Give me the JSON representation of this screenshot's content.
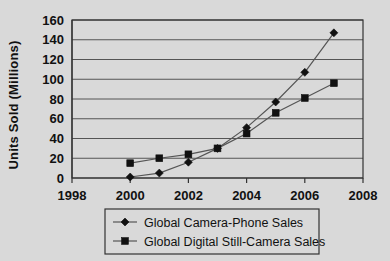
{
  "chart_data": {
    "type": "line",
    "title": "",
    "xlabel": "",
    "ylabel": "Units Sold  (Millions)",
    "x": [
      2000,
      2001,
      2002,
      2003,
      2004,
      2005,
      2006,
      2007
    ],
    "xlim": [
      1998,
      2008
    ],
    "ylim": [
      0,
      160
    ],
    "xticks": [
      "1998",
      "2000",
      "2002",
      "2004",
      "2006",
      "2008"
    ],
    "yticks": [
      "0",
      "20",
      "40",
      "60",
      "80",
      "100",
      "120",
      "140",
      "160"
    ],
    "grid": "horizontal",
    "legend_position": "bottom",
    "series": [
      {
        "name": "Global Camera-Phone Sales",
        "marker": "diamond",
        "values": [
          1,
          5,
          16,
          30,
          51,
          77,
          107,
          147
        ]
      },
      {
        "name": "Global Digital Still-Camera Sales",
        "marker": "square",
        "values": [
          15,
          20,
          24,
          30,
          45,
          66,
          81,
          96
        ]
      }
    ]
  },
  "colors": {
    "background": "#d9d9d9",
    "axis": "#333333",
    "gridline": "#555555",
    "marker": "#111111",
    "line": "#555555"
  }
}
